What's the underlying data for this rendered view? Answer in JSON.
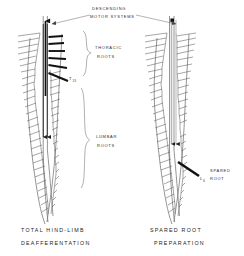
{
  "figure": {
    "title_annotation": {
      "line1": "DESCENDING",
      "line2": "MOTOR SYSTEMS"
    },
    "region_labels": [
      {
        "name": "thoracic-roots",
        "line1": "THORACIC",
        "line2": "ROOTS"
      },
      {
        "name": "lumbar-roots",
        "line1": "LUMBAR",
        "line2": "ROOTS"
      }
    ],
    "segment_labels": [
      {
        "name": "t13",
        "base": "T",
        "sub": "13"
      },
      {
        "name": "l6",
        "base": "L",
        "sub": "6"
      }
    ],
    "spared_root_label": {
      "line1": "SPARED",
      "line2": "ROOT"
    },
    "panels": [
      {
        "id": "left",
        "caption_line1": "TOTAL  HIND-LIMB",
        "caption_line2": "DEAFFERENTATION"
      },
      {
        "id": "right",
        "caption_line1": "SPARED    ROOT",
        "caption_line2": "PREPARATION"
      }
    ],
    "colors": {
      "background": "#ffffff",
      "ink": "#1a1a1a",
      "root_gray": "#5c5c5c",
      "cord_gray": "#7a7a7a",
      "tract_dark": "#111111",
      "tract_light": "#b4b4b4"
    }
  }
}
